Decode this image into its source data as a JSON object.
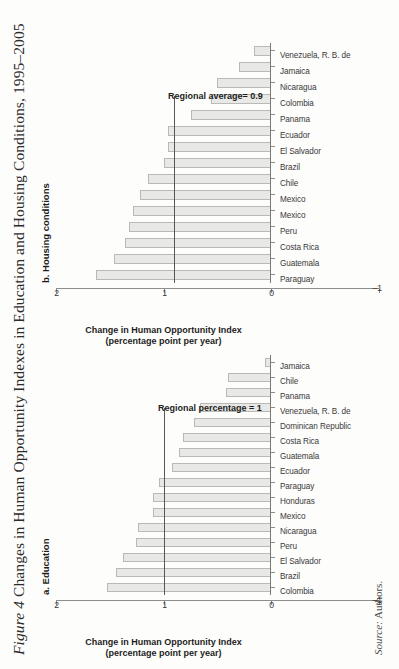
{
  "figure": {
    "number_label": "Figure 4",
    "title_text": " Changes in Human Opportunity Indexes in Education and Housing Conditions, 1995–2005",
    "source_label": "Source:",
    "source_text": " Authors."
  },
  "chart_data": [
    {
      "id": "education",
      "type": "bar",
      "title": "a. Education",
      "xlabel": "",
      "ylabel": "Change in Human Opportunity Index\n(percentage point per year)",
      "ylabel_line1": "Change in Human Opportunity Index",
      "ylabel_line2": "(percentage point per year)",
      "ylim": [
        -1,
        2
      ],
      "yticks": [
        -1,
        0,
        1,
        2
      ],
      "ytick_labels": [
        "–1",
        "0",
        "1",
        "2"
      ],
      "grid": false,
      "legend": "none",
      "reference_line": {
        "label": "Regional percentage = 1",
        "value": 1.0
      },
      "categories": [
        "Colombia",
        "Brazil",
        "El Salvador",
        "Peru",
        "Nicaragua",
        "Mexico",
        "Honduras",
        "Paraguay",
        "Ecuador",
        "Guatemala",
        "Costa Rica",
        "Dominican Republic",
        "Venezuela, R. B. de",
        "Panama",
        "Chile",
        "Jamaica"
      ],
      "values": [
        1.53,
        1.44,
        1.38,
        1.26,
        1.24,
        1.1,
        1.1,
        1.04,
        0.92,
        0.86,
        0.82,
        0.72,
        0.66,
        0.42,
        0.4,
        0.06
      ]
    },
    {
      "id": "housing",
      "type": "bar",
      "title": "b. Housing conditions",
      "xlabel": "",
      "ylabel": "Change in Human Opportunity Index\n(percentage point per year)",
      "ylabel_line1": "Change in Human Opportunity Index",
      "ylabel_line2": "(percentage point per year)",
      "ylim": [
        -1,
        2
      ],
      "yticks": [
        -1,
        0,
        1,
        2
      ],
      "ytick_labels": [
        "–1",
        "0",
        "1",
        "2"
      ],
      "grid": false,
      "legend": "none",
      "reference_line": {
        "label": "Regional average= 0.9",
        "value": 0.9
      },
      "categories": [
        "Paraguay",
        "Guatemala",
        "Costa Rica",
        "Peru",
        "Mexico",
        "Mexico",
        "Chile",
        "Brazil",
        "El Salvador",
        "Ecuador",
        "Panama",
        "Colombia",
        "Nicaragua",
        "Jamaica",
        "Venezuela, R. B. de"
      ],
      "values": [
        1.63,
        1.46,
        1.36,
        1.32,
        1.28,
        1.22,
        1.14,
        1.0,
        0.96,
        0.96,
        0.74,
        0.56,
        0.5,
        0.3,
        0.16
      ]
    }
  ]
}
